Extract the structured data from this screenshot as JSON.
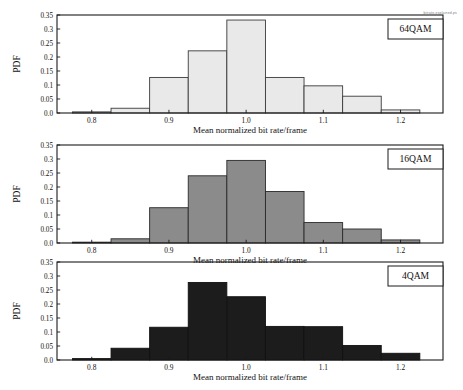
{
  "figure": {
    "watermark": "bitrate-explained.ps",
    "background": "#ffffff",
    "width": 463,
    "height": 390
  },
  "common": {
    "xlabel": "Mean normalized bit rate/frame",
    "ylabel": "PDF",
    "xticks": [
      "0.8",
      "0.9",
      "1.0",
      "1.1",
      "1.2"
    ],
    "xtick_values": [
      0.8,
      0.9,
      1.0,
      1.1,
      1.2
    ],
    "yticks": [
      "0.0",
      "0.05",
      "0.1",
      "0.15",
      "0.2",
      "0.25",
      "0.3",
      "0.35"
    ],
    "ytick_values": [
      0.0,
      0.05,
      0.1,
      0.15,
      0.2,
      0.25,
      0.3,
      0.35
    ],
    "xlim": [
      0.755,
      1.255
    ],
    "ylim": [
      0.0,
      0.35
    ],
    "axis_color": "#1a1a1a",
    "grid": false,
    "legend_position": "top-right"
  },
  "chart_data": [
    {
      "type": "bar",
      "panel_index": 0,
      "title": "",
      "legend_label": "64QAM",
      "xlabel": "Mean normalized bit rate/frame",
      "ylabel": "PDF",
      "xlim": [
        0.755,
        1.255
      ],
      "ylim": [
        0.0,
        0.35
      ],
      "bar_fill": "#e9e9e9",
      "bar_edge": "#3a3a3a",
      "bin_edges": [
        0.775,
        0.825,
        0.875,
        0.925,
        0.975,
        1.025,
        1.075,
        1.125,
        1.175,
        1.225
      ],
      "bin_centers": [
        0.8,
        0.85,
        0.9,
        0.95,
        1.0,
        1.05,
        1.1,
        1.15,
        1.2
      ],
      "values": [
        0.004,
        0.017,
        0.127,
        0.222,
        0.332,
        0.127,
        0.097,
        0.06,
        0.011
      ],
      "categories": [
        "0.80",
        "0.85",
        "0.90",
        "0.95",
        "1.00",
        "1.05",
        "1.10",
        "1.15",
        "1.20"
      ]
    },
    {
      "type": "bar",
      "panel_index": 1,
      "title": "",
      "legend_label": "16QAM",
      "xlabel": "Mean normalized bit rate/frame",
      "ylabel": "PDF",
      "xlim": [
        0.755,
        1.255
      ],
      "ylim": [
        0.0,
        0.35
      ],
      "bar_fill": "#8b8b8b",
      "bar_edge": "#2a2a2a",
      "bin_edges": [
        0.775,
        0.825,
        0.875,
        0.925,
        0.975,
        1.025,
        1.075,
        1.125,
        1.175,
        1.225
      ],
      "bin_centers": [
        0.8,
        0.85,
        0.9,
        0.95,
        1.0,
        1.05,
        1.1,
        1.15,
        1.2
      ],
      "values": [
        0.003,
        0.015,
        0.126,
        0.24,
        0.295,
        0.184,
        0.073,
        0.05,
        0.011
      ],
      "categories": [
        "0.80",
        "0.85",
        "0.90",
        "0.95",
        "1.00",
        "1.05",
        "1.10",
        "1.15",
        "1.20"
      ]
    },
    {
      "type": "bar",
      "panel_index": 2,
      "title": "",
      "legend_label": "4QAM",
      "xlabel": "Mean normalized bit rate/frame",
      "ylabel": "PDF",
      "xlim": [
        0.755,
        1.255
      ],
      "ylim": [
        0.0,
        0.35
      ],
      "bar_fill": "#1c1c1c",
      "bar_edge": "#111111",
      "bin_edges": [
        0.775,
        0.825,
        0.875,
        0.925,
        0.975,
        1.025,
        1.075,
        1.125,
        1.175,
        1.225
      ],
      "bin_centers": [
        0.8,
        0.85,
        0.9,
        0.95,
        1.0,
        1.05,
        1.1,
        1.15,
        1.2
      ],
      "values": [
        0.005,
        0.042,
        0.117,
        0.277,
        0.226,
        0.12,
        0.119,
        0.052,
        0.024
      ],
      "categories": [
        "0.80",
        "0.85",
        "0.90",
        "0.95",
        "1.00",
        "1.05",
        "1.10",
        "1.15",
        "1.20"
      ]
    }
  ]
}
